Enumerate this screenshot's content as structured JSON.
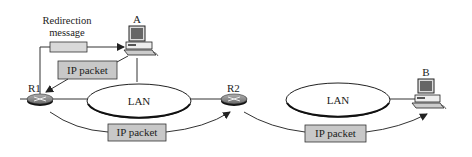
{
  "diagram": {
    "nodes": {
      "host_a": {
        "label": "A"
      },
      "host_b": {
        "label": "B"
      },
      "router_1": {
        "label": "R1"
      },
      "router_2": {
        "label": "R2"
      },
      "lan_1": {
        "label": "LAN"
      },
      "lan_2": {
        "label": "LAN"
      }
    },
    "messages": {
      "redirection": {
        "line1": "Redirection",
        "line2": "message"
      },
      "packet_a_to_r1": {
        "label": "IP packet"
      },
      "packet_r1_to_r2": {
        "label": "IP packet"
      },
      "packet_r2_to_b": {
        "label": "IP packet"
      }
    },
    "colors": {
      "packet_fill": "#c8c8c8",
      "redirect_fill": "#d9d9d9",
      "router_fill": "#8a8a8a",
      "line": "#333333"
    }
  }
}
